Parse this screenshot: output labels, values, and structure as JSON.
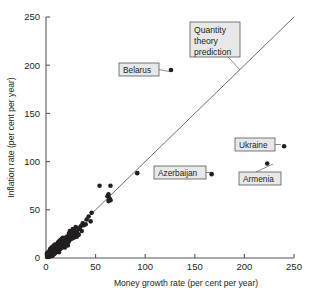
{
  "chart_data": {
    "type": "scatter",
    "title": "",
    "xlabel": "Money growth rate (per cent per year)",
    "ylabel": "Inflation rate (per cent per year)",
    "xlim": [
      0,
      250
    ],
    "ylim": [
      0,
      250
    ],
    "xticks": [
      "0",
      "50",
      "100",
      "150",
      "200",
      "250"
    ],
    "yticks": [
      "0",
      "50",
      "100",
      "150",
      "200",
      "250"
    ],
    "xtick_values": [
      0,
      50,
      100,
      150,
      200,
      250
    ],
    "ytick_values": [
      0,
      50,
      100,
      150,
      200,
      250
    ],
    "grid": false,
    "legend": "none",
    "reference_line": {
      "name": "Quantity theory prediction",
      "slope": 1,
      "intercept": 0,
      "x_start": 0,
      "y_start": 0,
      "x_end": 250,
      "y_end": 250
    },
    "series": [
      {
        "name": "Countries",
        "points": [
          [
            126,
            195
          ],
          [
            167,
            87
          ],
          [
            240,
            116
          ],
          [
            223,
            98
          ],
          [
            92,
            88
          ],
          [
            65,
            75
          ],
          [
            54,
            75
          ],
          [
            64,
            62
          ],
          [
            65,
            60
          ],
          [
            63,
            66
          ],
          [
            62,
            64
          ],
          [
            63,
            59
          ],
          [
            46,
            47
          ],
          [
            45,
            38
          ],
          [
            43,
            43
          ],
          [
            41,
            40
          ],
          [
            37,
            36
          ],
          [
            35,
            33
          ],
          [
            34,
            31
          ],
          [
            33,
            30
          ],
          [
            32,
            25
          ],
          [
            31,
            27
          ],
          [
            30,
            24
          ],
          [
            29,
            22
          ],
          [
            28,
            21
          ],
          [
            27,
            30
          ],
          [
            26,
            23
          ],
          [
            25,
            26
          ],
          [
            24,
            22
          ],
          [
            24,
            19
          ],
          [
            23,
            25
          ],
          [
            22,
            20
          ],
          [
            21,
            18
          ],
          [
            21,
            22
          ],
          [
            20,
            17
          ],
          [
            20,
            21
          ],
          [
            19,
            16
          ],
          [
            19,
            19
          ],
          [
            18,
            15
          ],
          [
            18,
            18
          ],
          [
            17,
            17
          ],
          [
            17,
            14
          ],
          [
            16,
            16
          ],
          [
            16,
            13
          ],
          [
            15,
            15
          ],
          [
            15,
            12
          ],
          [
            14,
            14
          ],
          [
            14,
            11
          ],
          [
            13,
            13
          ],
          [
            13,
            10
          ],
          [
            12,
            12
          ],
          [
            12,
            9
          ],
          [
            11,
            11
          ],
          [
            11,
            14
          ],
          [
            10,
            10
          ],
          [
            10,
            8
          ],
          [
            10,
            13
          ],
          [
            9,
            9
          ],
          [
            9,
            7
          ],
          [
            9,
            12
          ],
          [
            8,
            8
          ],
          [
            8,
            6
          ],
          [
            8,
            11
          ],
          [
            7,
            7
          ],
          [
            7,
            5
          ],
          [
            7,
            10
          ],
          [
            6,
            6
          ],
          [
            6,
            4
          ],
          [
            6,
            9
          ],
          [
            5,
            5
          ],
          [
            5,
            3
          ],
          [
            5,
            8
          ],
          [
            4,
            4
          ],
          [
            4,
            2
          ],
          [
            4,
            7
          ],
          [
            3,
            3
          ],
          [
            3,
            5
          ],
          [
            3,
            1
          ],
          [
            2,
            2
          ],
          [
            2,
            4
          ],
          [
            2,
            6
          ],
          [
            1,
            1
          ],
          [
            1,
            3
          ],
          [
            1,
            5
          ],
          [
            12,
            16
          ],
          [
            13,
            17
          ],
          [
            14,
            18
          ],
          [
            15,
            19
          ],
          [
            16,
            20
          ],
          [
            17,
            21
          ],
          [
            11,
            8
          ],
          [
            12,
            7
          ],
          [
            13,
            6
          ],
          [
            14,
            9
          ],
          [
            15,
            10
          ],
          [
            16,
            11
          ],
          [
            17,
            12
          ],
          [
            18,
            12
          ],
          [
            19,
            13
          ],
          [
            20,
            14
          ],
          [
            21,
            15
          ],
          [
            22,
            16
          ],
          [
            23,
            17
          ],
          [
            6,
            2
          ],
          [
            7,
            3
          ],
          [
            8,
            4
          ],
          [
            9,
            5
          ],
          [
            10,
            6
          ],
          [
            4,
            9
          ],
          [
            5,
            10
          ],
          [
            6,
            11
          ],
          [
            7,
            12
          ],
          [
            8,
            13
          ],
          [
            9,
            14
          ],
          [
            25,
            21
          ],
          [
            26,
            20
          ],
          [
            28,
            26
          ],
          [
            29,
            28
          ],
          [
            31,
            22
          ],
          [
            33,
            24
          ],
          [
            36,
            28
          ],
          [
            38,
            34
          ],
          [
            40,
            35
          ],
          [
            30,
            32
          ],
          [
            27,
            25
          ],
          [
            22,
            13
          ],
          [
            19,
            11
          ],
          [
            24,
            28
          ]
        ]
      }
    ],
    "annotations": [
      {
        "id": "belarus",
        "label": "Belarus",
        "lines": [
          "Belarus"
        ],
        "point": [
          126,
          195
        ],
        "box_x": 119,
        "box_y": 63,
        "box_w": 40,
        "box_h": 13,
        "leader_from_x": 159,
        "leader_from_y": 69.5,
        "leader_to_x": 169,
        "leader_to_y": 71.5
      },
      {
        "id": "quantity-theory-prediction",
        "label": "Quantity theory prediction",
        "lines": [
          "Quantity",
          "theory",
          "prediction"
        ],
        "point": [
          196,
          196
        ],
        "box_x": 190,
        "box_y": 22,
        "box_w": 50,
        "box_h": 35,
        "leader_from_x": 228,
        "leader_from_y": 57,
        "leader_to_x": 240,
        "leader_to_y": 70
      },
      {
        "id": "azerbaijan",
        "label": "Azerbaijan",
        "lines": [
          "Azerbaijan"
        ],
        "point": [
          167,
          87
        ],
        "box_x": 154,
        "box_y": 166,
        "box_w": 52,
        "box_h": 13,
        "leader_from_x": 206,
        "leader_from_y": 172.5,
        "leader_to_x": 210,
        "leader_to_y": 172.5
      },
      {
        "id": "ukraine",
        "label": "Ukraine",
        "lines": [
          "Ukraine"
        ],
        "point": [
          240,
          116
        ],
        "box_x": 235,
        "box_y": 138,
        "box_w": 40,
        "box_h": 13,
        "leader_from_x": 275,
        "leader_from_y": 144.5,
        "leader_to_x": 281,
        "leader_to_y": 144.5
      },
      {
        "id": "armenia",
        "label": "Armenia",
        "lines": [
          "Armenia"
        ],
        "point": [
          223,
          98
        ],
        "box_x": 239,
        "box_y": 172,
        "box_w": 42,
        "box_h": 13,
        "leader_from_x": 256,
        "leader_from_y": 172,
        "leader_to_x": 273,
        "leader_to_y": 164
      }
    ]
  },
  "colors": {
    "dot": "#231f20",
    "axis": "#58595b",
    "line": "#6d6e71",
    "callout_fill": "#e8e8e8",
    "callout_border": "#58595b",
    "background": "#ffffff"
  }
}
